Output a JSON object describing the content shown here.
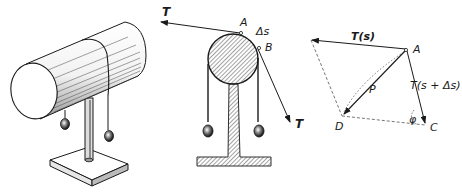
{
  "figure": {
    "panels": [
      {
        "id": "perspective",
        "description": "Horizontal cylinder on pedestal stand with a string draped over it carrying two weights"
      },
      {
        "id": "cross_section",
        "description": "Cross-section of cylinder on T-shaped stand, string tension T at both ends, arc element Δs between A and B"
      },
      {
        "id": "force_diagram",
        "description": "Vector diagram: T(s), T(s+Δs), resultant P, points A, C, D and angle φ"
      }
    ]
  },
  "labels": {
    "cross_section": {
      "tension_left": "T",
      "tension_right": "T",
      "point_a": "A",
      "point_b": "B",
      "arc_element": "Δs"
    },
    "force_diagram": {
      "tension_s": "T(s)",
      "tension_s_ds": "T(s + Δs)",
      "resultant": "P",
      "point_a": "A",
      "point_c": "C",
      "point_d": "D",
      "angle": "φ"
    }
  },
  "colors": {
    "ink": "#1a1a1a",
    "dashed": "#666666",
    "background": "#ffffff"
  }
}
